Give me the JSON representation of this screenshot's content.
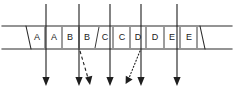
{
  "diagram": {
    "canvas": {
      "width": 234,
      "height": 94,
      "background": "#ffffff"
    },
    "ink_color": "#1e1e1e",
    "band": {
      "name": "sequence-band",
      "top_y": 26,
      "bottom_y": 49,
      "left_x": 2,
      "right_x": 232,
      "left_notch_x": 26,
      "right_notch_x": 205
    },
    "cells": [
      {
        "index": 0,
        "label": "A",
        "center_x": 37,
        "left_x": 30,
        "right_x": 45
      },
      {
        "index": 1,
        "label": "A",
        "center_x": 54,
        "left_x": 45,
        "right_x": 62
      },
      {
        "index": 2,
        "label": "B",
        "center_x": 70,
        "left_x": 62,
        "right_x": 79
      },
      {
        "index": 3,
        "label": "B",
        "center_x": 87,
        "left_x": 79,
        "right_x": 95
      },
      {
        "index": 4,
        "label": "C",
        "center_x": 105,
        "left_x": 97,
        "right_x": 113
      },
      {
        "index": 5,
        "label": "C",
        "center_x": 122,
        "left_x": 113,
        "right_x": 130
      },
      {
        "index": 6,
        "label": "D",
        "center_x": 138,
        "left_x": 130,
        "right_x": 146
      },
      {
        "index": 7,
        "label": "D",
        "center_x": 155,
        "left_x": 146,
        "right_x": 163
      },
      {
        "index": 8,
        "label": "E",
        "center_x": 172,
        "left_x": 165,
        "right_x": 180
      },
      {
        "index": 9,
        "label": "E",
        "center_x": 189,
        "left_x": 180,
        "right_x": 197
      }
    ],
    "pointers": [
      {
        "id": "p1",
        "style": "solid",
        "name": "pointer-arrow-1",
        "x1": 46,
        "y1": 4,
        "x2": 46,
        "y2": 84
      },
      {
        "id": "p2",
        "style": "solid",
        "name": "pointer-arrow-2",
        "x1": 79,
        "y1": 4,
        "x2": 79,
        "y2": 84
      },
      {
        "id": "p3",
        "style": "solid",
        "name": "pointer-arrow-3",
        "x1": 110,
        "y1": 4,
        "x2": 110,
        "y2": 84
      },
      {
        "id": "p4",
        "style": "solid",
        "name": "pointer-arrow-4",
        "x1": 141,
        "y1": 4,
        "x2": 141,
        "y2": 84
      },
      {
        "id": "p5",
        "style": "solid",
        "name": "pointer-arrow-5",
        "x1": 177,
        "y1": 4,
        "x2": 177,
        "y2": 84
      },
      {
        "id": "p6",
        "style": "dashed",
        "name": "pointer-arrow-dashed",
        "x1": 80,
        "y1": 50,
        "x2": 89,
        "y2": 82
      },
      {
        "id": "p7",
        "style": "dotted",
        "name": "pointer-arrow-dotted",
        "x1": 140,
        "y1": 50,
        "x2": 127,
        "y2": 82
      }
    ]
  }
}
